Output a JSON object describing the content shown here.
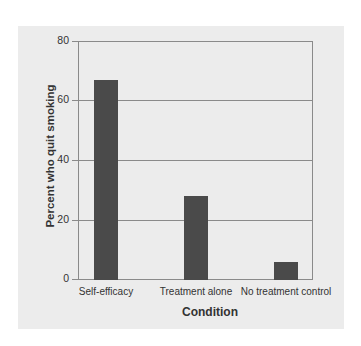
{
  "chart_data": {
    "type": "bar",
    "title": "",
    "categories": [
      "Self-efficacy",
      "Treatment alone",
      "No treatment control"
    ],
    "values": [
      67,
      28,
      6
    ],
    "xlabel": "Condition",
    "ylabel": "Percent who quit smoking",
    "ylim": [
      0,
      80
    ],
    "yticks": [
      "0",
      "20",
      "40",
      "60",
      "80"
    ],
    "grid": true,
    "legend": null,
    "bar_color": "#4a4a4a",
    "background_color": "#ececec"
  }
}
